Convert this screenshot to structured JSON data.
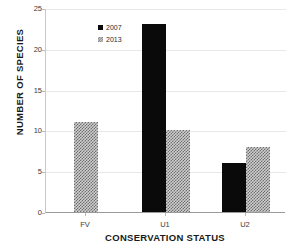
{
  "chart_data": {
    "type": "bar",
    "title": "",
    "subtitle": "",
    "xlabel": "CONSERVATION STATUS",
    "ylabel": "NUMBER OF SPECIES",
    "categories": [
      "FV",
      "U1",
      "U2"
    ],
    "series": [
      {
        "name": "2007",
        "values": [
          null,
          23,
          6
        ],
        "color": "#0a0a0a",
        "pattern": "solid"
      },
      {
        "name": "2013",
        "values": [
          11,
          10,
          8
        ],
        "color": "#cfcfcf",
        "pattern": "diagonal-hatch"
      }
    ],
    "ylim": [
      0,
      25
    ],
    "yticks": [
      0,
      5,
      10,
      15,
      20,
      25
    ],
    "ytick_labels": [
      "0",
      "5",
      "10",
      "15",
      "20",
      "25"
    ],
    "grid": "horizontal",
    "legend_position": "top-left",
    "annotations": []
  },
  "legend": {
    "entries": [
      {
        "label": "2007",
        "swatch": "solid-square-marker"
      },
      {
        "label": "2013",
        "swatch": "hatched-square-marker"
      }
    ]
  },
  "colors": {
    "series_2007": "#0a0a0a",
    "series_2013_fill": "#cfcfcf",
    "series_2013_hatch": "#6d6d6d",
    "gridline": "#e8e8e8",
    "axis": "#9a9a9a",
    "background": "#ffffff",
    "text": "#1a1a1a"
  }
}
